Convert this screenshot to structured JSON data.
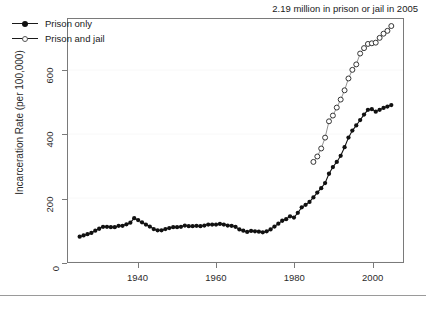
{
  "figure": {
    "background_color": "#ffffff",
    "frame_color": "#7a7a7a",
    "annotation": "2.19 million in prison or jail in 2005"
  },
  "axes": {
    "y_title": "Incarceration Rate (per 100,000)",
    "y_ticks": [
      0,
      200,
      400,
      600
    ],
    "y_tick_labels": [
      "0",
      "200",
      "400",
      "600"
    ],
    "x_ticks": [
      1940,
      1960,
      1980,
      2000
    ],
    "x_tick_labels": [
      "1940",
      "1960",
      "1980",
      "2000"
    ]
  },
  "legend": {
    "items": [
      {
        "label": "Prison only",
        "marker": "filled-circle",
        "color": "#111111"
      },
      {
        "label": "Prison and jail",
        "marker": "open-circle",
        "color": "#555555"
      }
    ]
  },
  "chart_data": {
    "type": "scatter",
    "title": "",
    "subtitle": "",
    "xlabel": "",
    "ylabel": "Incarceration Rate (per 100,000)",
    "xlim": [
      1922,
      2008
    ],
    "ylim": [
      0,
      760
    ],
    "grid": true,
    "legend_position": "top-left",
    "annotations": [
      {
        "text": "2.19 million in prison or jail in 2005",
        "position": "top-right"
      }
    ],
    "series": [
      {
        "name": "Prison only",
        "marker": "filled-circle",
        "color": "#111111",
        "x": [
          1925,
          1926,
          1927,
          1928,
          1929,
          1930,
          1931,
          1932,
          1933,
          1934,
          1935,
          1936,
          1937,
          1938,
          1939,
          1940,
          1941,
          1942,
          1943,
          1944,
          1945,
          1946,
          1947,
          1948,
          1949,
          1950,
          1951,
          1952,
          1953,
          1954,
          1955,
          1956,
          1957,
          1958,
          1959,
          1960,
          1961,
          1962,
          1963,
          1964,
          1965,
          1966,
          1967,
          1968,
          1969,
          1970,
          1971,
          1972,
          1973,
          1974,
          1975,
          1976,
          1977,
          1978,
          1979,
          1980,
          1981,
          1982,
          1983,
          1984,
          1985,
          1986,
          1987,
          1988,
          1989,
          1990,
          1991,
          1992,
          1993,
          1994,
          1995,
          1996,
          1997,
          1998,
          1999,
          2000,
          2001,
          2002,
          2003,
          2004,
          2005
        ],
        "y": [
          79,
          83,
          87,
          91,
          98,
          104,
          110,
          110,
          109,
          109,
          113,
          113,
          118,
          123,
          137,
          131,
          124,
          117,
          111,
          103,
          99,
          99,
          103,
          106,
          109,
          109,
          110,
          114,
          112,
          112,
          113,
          112,
          114,
          117,
          117,
          117,
          119,
          117,
          114,
          113,
          110,
          102,
          98,
          94,
          97,
          96,
          95,
          93,
          96,
          102,
          111,
          120,
          129,
          134,
          143,
          139,
          154,
          171,
          179,
          188,
          202,
          217,
          231,
          247,
          276,
          297,
          313,
          332,
          359,
          389,
          411,
          427,
          444,
          461,
          476,
          478,
          470,
          476,
          482,
          486,
          491
        ]
      },
      {
        "name": "Prison and jail",
        "marker": "open-circle",
        "color": "#555555",
        "x": [
          1985,
          1986,
          1987,
          1988,
          1989,
          1990,
          1991,
          1992,
          1993,
          1994,
          1995,
          1996,
          1997,
          1998,
          1999,
          2000,
          2001,
          2002,
          2003,
          2004,
          2005
        ],
        "y": [
          313,
          330,
          355,
          389,
          440,
          458,
          483,
          508,
          537,
          574,
          601,
          618,
          652,
          669,
          682,
          684,
          686,
          701,
          714,
          723,
          738
        ]
      }
    ]
  }
}
